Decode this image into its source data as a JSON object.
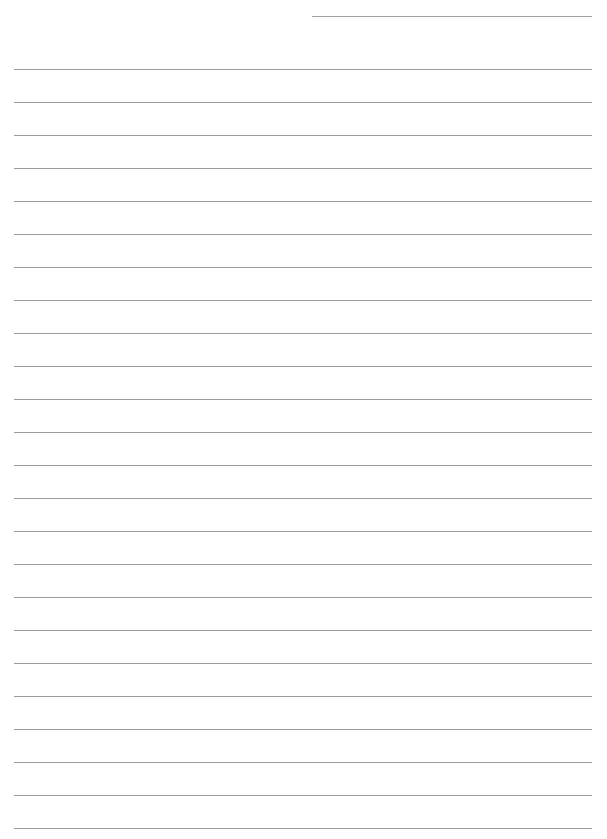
{
  "page": {
    "type": "lined-writing-paper",
    "background_color": "#ffffff",
    "line_color": "#9c9c9c"
  },
  "header": {
    "name_line": {
      "x": 312,
      "y": 16,
      "width": 280
    }
  },
  "ruling": {
    "line_count": 24,
    "first_line_y": 69,
    "line_spacing": 33,
    "left_margin": 14,
    "line_width": 578
  }
}
